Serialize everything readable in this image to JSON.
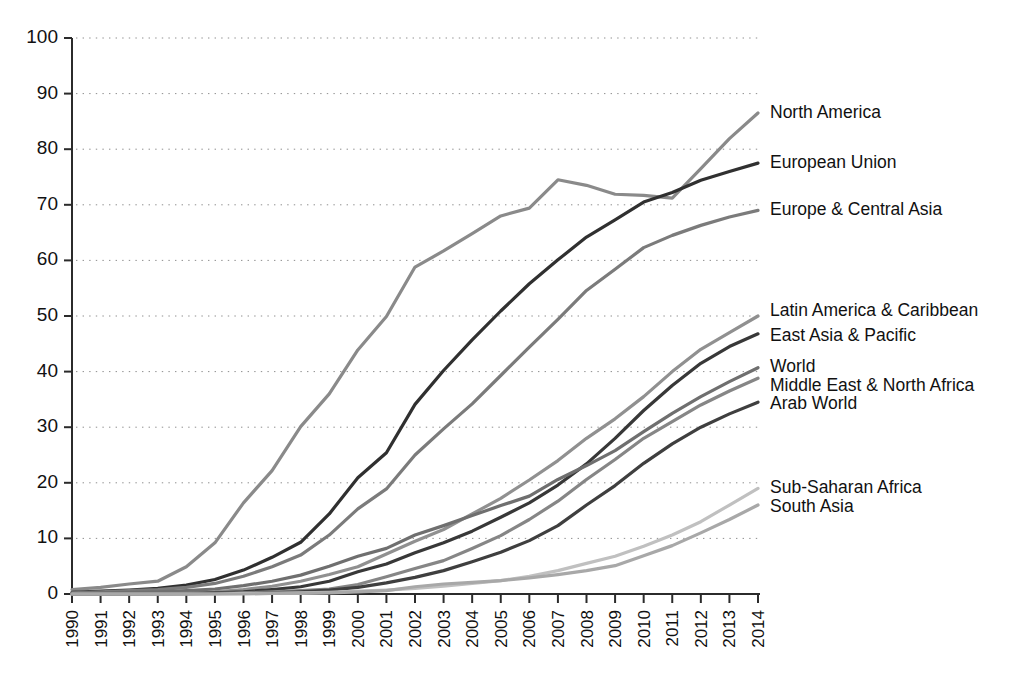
{
  "chart_data": {
    "type": "line",
    "title": "",
    "subtitle": "",
    "xlabel": "",
    "ylabel": "",
    "xlim": [
      1990,
      2014
    ],
    "ylim": [
      0,
      100
    ],
    "grid": true,
    "legend_position": "right-inline-labels",
    "x": [
      1990,
      1991,
      1992,
      1993,
      1994,
      1995,
      1996,
      1997,
      1998,
      1999,
      2000,
      2001,
      2002,
      2003,
      2004,
      2005,
      2006,
      2007,
      2008,
      2009,
      2010,
      2011,
      2012,
      2013,
      2014
    ],
    "categories": [
      "1990",
      "1991",
      "1992",
      "1993",
      "1994",
      "1995",
      "1996",
      "1997",
      "1998",
      "1999",
      "2000",
      "2001",
      "2002",
      "2003",
      "2004",
      "2005",
      "2006",
      "2007",
      "2008",
      "2009",
      "2010",
      "2011",
      "2012",
      "2013",
      "2014"
    ],
    "ytick_labels": [
      "0",
      "10",
      "20",
      "30",
      "40",
      "50",
      "60",
      "70",
      "80",
      "90",
      "100"
    ],
    "ytick_values": [
      0,
      10,
      20,
      30,
      40,
      50,
      60,
      70,
      80,
      90,
      100
    ],
    "series": [
      {
        "name": "North America",
        "color": "#8a8a8a",
        "label_value": 86.5,
        "values": [
          0.8,
          1.2,
          1.8,
          2.3,
          4.9,
          9.2,
          16.4,
          22.2,
          30.1,
          36.0,
          43.9,
          49.9,
          58.8,
          61.7,
          64.8,
          68.0,
          69.4,
          74.5,
          73.5,
          71.9,
          71.7,
          71.2,
          76.5,
          81.9,
          86.5
        ]
      },
      {
        "name": "European Union",
        "color": "#303030",
        "label_value": 77.5,
        "values": [
          0.3,
          0.5,
          0.7,
          1.0,
          1.6,
          2.6,
          4.3,
          6.6,
          9.3,
          14.4,
          20.9,
          25.4,
          34.1,
          40.2,
          45.7,
          50.9,
          55.8,
          60.1,
          64.2,
          67.3,
          70.5,
          72.2,
          74.4,
          76.0,
          77.5
        ]
      },
      {
        "name": "Europe & Central Asia",
        "color": "#7b7b7b",
        "label_value": 69.0,
        "values": [
          0.2,
          0.4,
          0.6,
          0.8,
          1.2,
          1.9,
          3.2,
          4.9,
          7.0,
          10.6,
          15.3,
          18.9,
          25.0,
          29.7,
          34.2,
          39.3,
          44.4,
          49.4,
          54.6,
          58.4,
          62.3,
          64.5,
          66.3,
          67.8,
          69.0
        ]
      },
      {
        "name": "Latin America & Caribbean",
        "color": "#909090",
        "label_value": 50.0,
        "values": [
          0.0,
          0.0,
          0.1,
          0.1,
          0.2,
          0.4,
          0.8,
          1.4,
          2.3,
          3.5,
          4.9,
          7.2,
          9.5,
          11.6,
          14.4,
          17.2,
          20.5,
          24.0,
          28.0,
          31.5,
          35.5,
          40.0,
          44.0,
          47.0,
          50.0
        ]
      },
      {
        "name": "East Asia & Pacific",
        "color": "#383838",
        "label_value": 46.8,
        "values": [
          0.0,
          0.0,
          0.0,
          0.1,
          0.1,
          0.2,
          0.4,
          0.8,
          1.3,
          2.3,
          4.0,
          5.4,
          7.4,
          9.2,
          11.3,
          13.8,
          16.4,
          19.6,
          23.4,
          28.0,
          33.0,
          37.5,
          41.5,
          44.5,
          46.8
        ]
      },
      {
        "name": "World",
        "color": "#6f6f6f",
        "label_value": 40.7,
        "values": [
          0.1,
          0.2,
          0.3,
          0.4,
          0.6,
          0.9,
          1.5,
          2.3,
          3.4,
          5.0,
          6.8,
          8.2,
          10.6,
          12.3,
          14.1,
          15.9,
          17.6,
          20.6,
          23.1,
          25.8,
          29.2,
          32.5,
          35.5,
          38.2,
          40.7
        ]
      },
      {
        "name": "Middle East & North Africa",
        "color": "#868686",
        "label_value": 38.8,
        "values": [
          0.0,
          0.0,
          0.0,
          0.0,
          0.1,
          0.1,
          0.2,
          0.4,
          0.6,
          0.9,
          1.7,
          3.1,
          4.6,
          6.0,
          8.2,
          10.5,
          13.4,
          16.7,
          20.6,
          24.2,
          28.0,
          31.0,
          34.0,
          36.5,
          38.8
        ]
      },
      {
        "name": "Arab World",
        "color": "#3f3f3f",
        "label_value": 34.5,
        "values": [
          0.0,
          0.0,
          0.0,
          0.0,
          0.0,
          0.1,
          0.1,
          0.2,
          0.4,
          0.7,
          1.2,
          2.0,
          3.0,
          4.2,
          5.8,
          7.5,
          9.6,
          12.3,
          16.0,
          19.5,
          23.5,
          27.0,
          30.0,
          32.4,
          34.5
        ]
      },
      {
        "name": "Sub-Saharan Africa",
        "color": "#c0c0c0",
        "label_value": 19.0,
        "values": [
          0.0,
          0.0,
          0.0,
          0.0,
          0.0,
          0.0,
          0.1,
          0.1,
          0.2,
          0.3,
          0.5,
          0.7,
          1.0,
          1.4,
          1.9,
          2.4,
          3.2,
          4.2,
          5.5,
          6.8,
          8.6,
          10.6,
          13.0,
          16.0,
          19.0
        ]
      },
      {
        "name": "South Asia",
        "color": "#a8a8a8",
        "label_value": 16.0,
        "values": [
          0.0,
          0.0,
          0.0,
          0.0,
          0.0,
          0.0,
          0.0,
          0.1,
          0.1,
          0.2,
          0.4,
          0.6,
          1.3,
          1.8,
          2.1,
          2.4,
          2.9,
          3.5,
          4.2,
          5.1,
          6.9,
          8.7,
          11.0,
          13.4,
          16.0
        ]
      }
    ],
    "label_annotations": [
      {
        "text": "North America",
        "y": 86.5
      },
      {
        "text": "European Union",
        "y": 77.5
      },
      {
        "text": "Europe & Central Asia",
        "y": 69.0
      },
      {
        "text": "Latin America & Caribbean",
        "y": 50.8
      },
      {
        "text": "East Asia & Pacific",
        "y": 46.4
      },
      {
        "text": "World",
        "y": 40.7
      },
      {
        "text": "Middle East & North Africa",
        "y": 37.4
      },
      {
        "text": "Arab World",
        "y": 34.1
      },
      {
        "text": "Sub-Saharan Africa",
        "y": 19.0
      },
      {
        "text": "South Asia",
        "y": 15.6
      }
    ]
  }
}
